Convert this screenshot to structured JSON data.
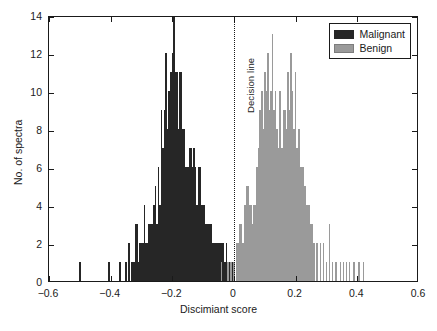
{
  "chart_data": {
    "type": "bar",
    "title": "",
    "subtitle": "",
    "xlabel": "Discimiant score",
    "ylabel": "No. of spectra",
    "xlim": [
      -0.6,
      0.6
    ],
    "ylim": [
      0,
      14
    ],
    "xticks": [
      -0.6,
      -0.4,
      -0.2,
      0,
      0.2,
      0.4,
      0.6
    ],
    "xticklabels": [
      "−0.6",
      "−0.4",
      "−0.2",
      "0",
      "0.2",
      "0.4",
      "0.6"
    ],
    "yticks": [
      0,
      2,
      4,
      6,
      8,
      10,
      12,
      14
    ],
    "yticklabels": [
      "0",
      "2",
      "4",
      "6",
      "8",
      "10",
      "12",
      "14"
    ],
    "grid": false,
    "legend_position": "top-right",
    "bin_width": 0.005,
    "annotations": [
      {
        "name": "decision-line",
        "text": "Decision line",
        "x": 0.0,
        "style": "dotted-vertical"
      }
    ],
    "series": [
      {
        "name": "Malignant",
        "color": "#262626",
        "x": [
          -0.5,
          -0.405,
          -0.37,
          -0.35,
          -0.34,
          -0.33,
          -0.325,
          -0.32,
          -0.315,
          -0.31,
          -0.305,
          -0.3,
          -0.295,
          -0.29,
          -0.285,
          -0.28,
          -0.275,
          -0.27,
          -0.265,
          -0.26,
          -0.255,
          -0.25,
          -0.245,
          -0.24,
          -0.235,
          -0.23,
          -0.225,
          -0.22,
          -0.215,
          -0.21,
          -0.205,
          -0.2,
          -0.195,
          -0.19,
          -0.185,
          -0.18,
          -0.175,
          -0.17,
          -0.165,
          -0.16,
          -0.155,
          -0.15,
          -0.145,
          -0.14,
          -0.135,
          -0.13,
          -0.125,
          -0.12,
          -0.115,
          -0.11,
          -0.105,
          -0.1,
          -0.095,
          -0.09,
          -0.085,
          -0.08,
          -0.075,
          -0.07,
          -0.065,
          -0.06,
          -0.055,
          -0.05,
          -0.045,
          -0.04,
          -0.035,
          -0.03,
          -0.025,
          -0.02,
          -0.015,
          -0.01,
          -0.005,
          0.0,
          0.01,
          0.02,
          0.03,
          0.045,
          0.06,
          0.075,
          0.09
        ],
        "values": [
          1,
          1,
          1,
          1,
          2,
          1,
          1,
          3,
          3,
          1,
          2,
          2,
          2,
          4,
          2,
          2,
          3,
          3,
          3,
          4,
          5,
          3,
          6,
          4,
          9,
          7,
          9,
          12,
          8,
          10,
          11,
          12,
          14,
          11,
          11,
          8,
          11,
          11,
          8,
          8,
          6,
          6,
          7,
          7,
          6,
          7,
          6,
          4,
          6,
          6,
          4,
          4,
          4,
          3,
          3,
          3,
          3,
          2,
          2,
          2,
          2,
          2,
          2,
          2,
          2,
          1,
          2,
          1,
          1,
          1,
          1,
          1,
          2,
          1,
          2,
          1,
          1,
          1,
          1
        ]
      },
      {
        "name": "Benign",
        "color": "#9a9a9a",
        "x": [
          -0.04,
          -0.02,
          -0.01,
          0.0,
          0.01,
          0.015,
          0.02,
          0.025,
          0.03,
          0.035,
          0.04,
          0.045,
          0.05,
          0.055,
          0.06,
          0.065,
          0.07,
          0.075,
          0.08,
          0.085,
          0.09,
          0.095,
          0.1,
          0.105,
          0.11,
          0.115,
          0.12,
          0.125,
          0.13,
          0.135,
          0.14,
          0.145,
          0.15,
          0.155,
          0.16,
          0.165,
          0.17,
          0.175,
          0.18,
          0.185,
          0.19,
          0.195,
          0.2,
          0.205,
          0.21,
          0.215,
          0.22,
          0.225,
          0.23,
          0.235,
          0.24,
          0.245,
          0.25,
          0.255,
          0.26,
          0.27,
          0.28,
          0.29,
          0.3,
          0.31,
          0.32,
          0.33,
          0.345,
          0.355,
          0.365,
          0.375,
          0.39,
          0.405,
          0.42
        ],
        "values": [
          1,
          1,
          1,
          1,
          2,
          2,
          3,
          3,
          2,
          4,
          5,
          5,
          4,
          4,
          3,
          4,
          4,
          6,
          7,
          9,
          10,
          8,
          11,
          10,
          12,
          9,
          10,
          13,
          9,
          10,
          8,
          7,
          10,
          7,
          9,
          9,
          8,
          11,
          9,
          12,
          10,
          8,
          11,
          7,
          8,
          6,
          6,
          6,
          5,
          4,
          4,
          4,
          3,
          3,
          2,
          2,
          2,
          2,
          1,
          3,
          1,
          1,
          1,
          1,
          1,
          1,
          1,
          1,
          1
        ]
      }
    ]
  },
  "legend": {
    "items": [
      {
        "label": "Malignant",
        "color": "#262626"
      },
      {
        "label": "Benign",
        "color": "#9a9a9a"
      }
    ]
  }
}
